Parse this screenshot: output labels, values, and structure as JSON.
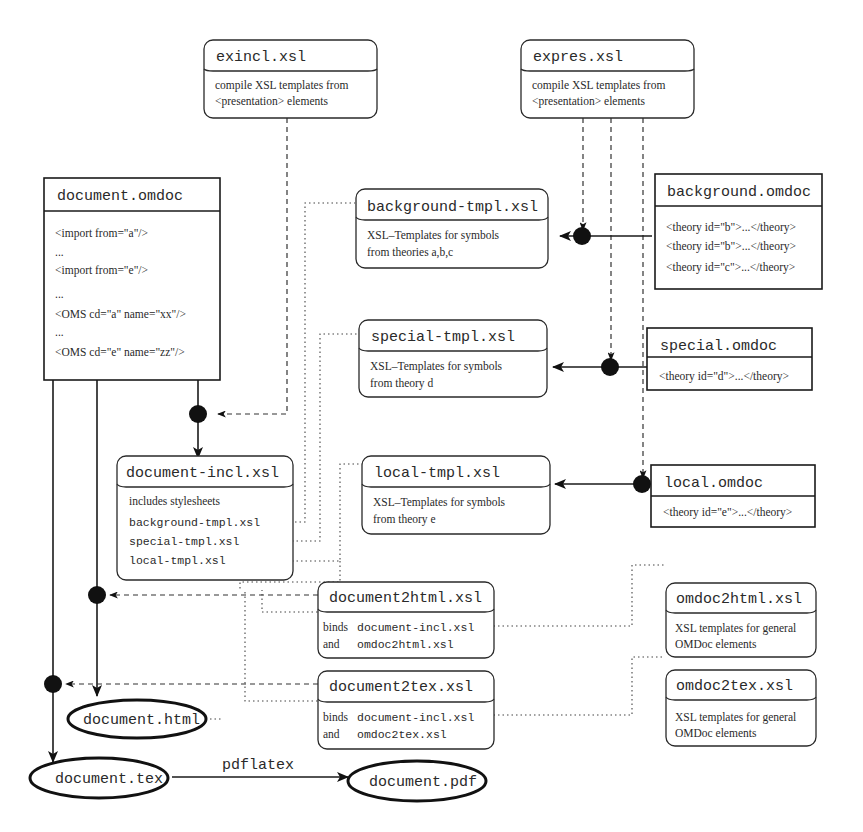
{
  "diagram": {
    "exincl": {
      "title": "exincl.xsl",
      "lines": [
        "compile XSL templates from",
        "<presentation> elements"
      ]
    },
    "expres": {
      "title": "expres.xsl",
      "lines": [
        "compile XSL templates from",
        "<presentation> elements"
      ]
    },
    "document_omdoc": {
      "title": "document.omdoc",
      "lines": [
        "<import from=\"a\"/>",
        "...",
        "<import from=\"e\"/>",
        "...",
        "<OMS cd=\"a\" name=\"xx\"/>",
        "...",
        "<OMS cd=\"e\" name=\"zz\"/>"
      ]
    },
    "background_tmpl": {
      "title": "background-tmpl.xsl",
      "lines": [
        "XSL–Templates for symbols",
        "from theories a,b,c"
      ]
    },
    "background_omdoc": {
      "title": "background.omdoc",
      "lines": [
        "<theory id=\"b\">...</theory>",
        "<theory id=\"b\">...</theory>",
        "<theory id=\"c\">...</theory>"
      ]
    },
    "special_tmpl": {
      "title": "special-tmpl.xsl",
      "lines": [
        "XSL–Templates for symbols",
        "from theory d"
      ]
    },
    "special_omdoc": {
      "title": "special.omdoc",
      "lines": [
        "<theory id=\"d\">...</theory>"
      ]
    },
    "local_tmpl": {
      "title": "local-tmpl.xsl",
      "lines": [
        "XSL–Templates for symbols",
        "from theory e"
      ]
    },
    "local_omdoc": {
      "title": "local.omdoc",
      "lines": [
        "<theory id=\"e\">...</theory>"
      ]
    },
    "document_incl": {
      "title": "document-incl.xsl",
      "heading": "includes stylesheets",
      "includes": [
        "background-tmpl.xsl",
        "special-tmpl.xsl",
        "local-tmpl.xsl"
      ]
    },
    "document2html": {
      "title": "document2html.xsl",
      "binds_word": "binds",
      "binds_target": "document-incl.xsl",
      "and_word": "and",
      "and_target": "omdoc2html.xsl"
    },
    "omdoc2html": {
      "title": "omdoc2html.xsl",
      "lines": [
        "XSL templates for general",
        "OMDoc elements"
      ]
    },
    "document2tex": {
      "title": "document2tex.xsl",
      "binds_word": "binds",
      "binds_target": "document-incl.xsl",
      "and_word": "and",
      "and_target": "omdoc2tex.xsl"
    },
    "omdoc2tex": {
      "title": "omdoc2tex.xsl",
      "lines": [
        "XSL templates for general",
        "OMDoc elements"
      ]
    },
    "outputs": {
      "html": "document.html",
      "tex": "document.tex",
      "pdf": "document.pdf"
    },
    "edge_labels": {
      "pdflatex": "pdflatex"
    }
  }
}
